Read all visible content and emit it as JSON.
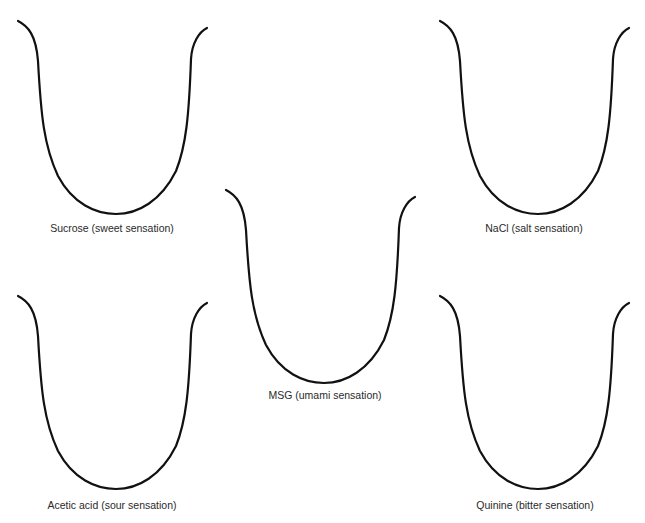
{
  "top_clipped_text": "",
  "panels": [
    {
      "id": "sucrose",
      "label": "Sucrose (sweet sensation)",
      "origin": [
        18,
        21
      ],
      "label_pos": [
        112,
        222
      ]
    },
    {
      "id": "nacl",
      "label": "NaCl (salt sensation)",
      "origin": [
        440,
        21
      ],
      "label_pos": [
        534,
        222
      ]
    },
    {
      "id": "msg",
      "label": "MSG (umami sensation)",
      "origin": [
        226,
        190
      ],
      "label_pos": [
        325,
        389
      ]
    },
    {
      "id": "acetic",
      "label": "Acetic acid (sour sensation)",
      "origin": [
        18,
        296
      ],
      "label_pos": [
        112,
        499
      ]
    },
    {
      "id": "quinine",
      "label": "Quinine (bitter sensation)",
      "origin": [
        440,
        296
      ],
      "label_pos": [
        535,
        499
      ]
    }
  ],
  "colors": {
    "stroke": "#111111",
    "text": "#2a2a2a",
    "background": "#ffffff"
  }
}
